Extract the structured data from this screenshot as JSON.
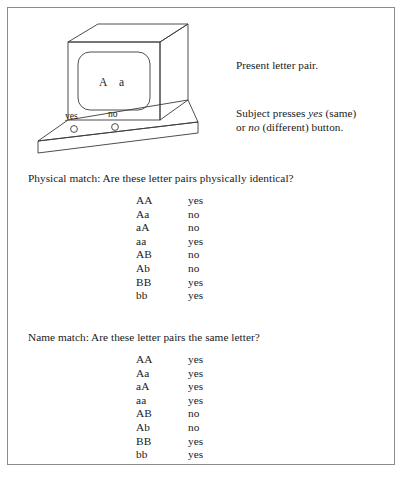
{
  "figure": {
    "apparatus": {
      "screen_text": "A  a",
      "screen_letter_left": "A",
      "screen_letter_right": "a",
      "button_label_yes": "yes",
      "button_label_no": "no"
    },
    "notes": {
      "present": "Present letter pair.",
      "press_prefix": "Subject presses ",
      "press_yes": "yes",
      "press_mid": " (same)",
      "press_line2_prefix": "or ",
      "press_no": "no",
      "press_line2_suffix": " (different) button."
    },
    "physical_match": {
      "heading": "Physical match: Are these letter pairs physically identical?",
      "columns": [
        "pair",
        "answer"
      ],
      "rows": [
        {
          "pair": "AA",
          "answer": "yes"
        },
        {
          "pair": "Aa",
          "answer": "no"
        },
        {
          "pair": "aA",
          "answer": "no"
        },
        {
          "pair": "aa",
          "answer": "yes"
        },
        {
          "pair": "AB",
          "answer": "no"
        },
        {
          "pair": "Ab",
          "answer": "no"
        },
        {
          "pair": "BB",
          "answer": "yes"
        },
        {
          "pair": "bb",
          "answer": "yes"
        }
      ]
    },
    "name_match": {
      "heading": "Name match: Are these letter pairs the same letter?",
      "columns": [
        "pair",
        "answer"
      ],
      "rows": [
        {
          "pair": "AA",
          "answer": "yes"
        },
        {
          "pair": "Aa",
          "answer": "yes"
        },
        {
          "pair": "aA",
          "answer": "yes"
        },
        {
          "pair": "aa",
          "answer": "yes"
        },
        {
          "pair": "AB",
          "answer": "no"
        },
        {
          "pair": "Ab",
          "answer": "no"
        },
        {
          "pair": "BB",
          "answer": "yes"
        },
        {
          "pair": "bb",
          "answer": "yes"
        }
      ]
    },
    "bottom_caption": "clipped caption text"
  },
  "colors": {
    "frame_border": "#8b8b8b",
    "line_art": "#3a3a3a",
    "text": "#1a1a1a",
    "page_background": "#ffffff"
  }
}
